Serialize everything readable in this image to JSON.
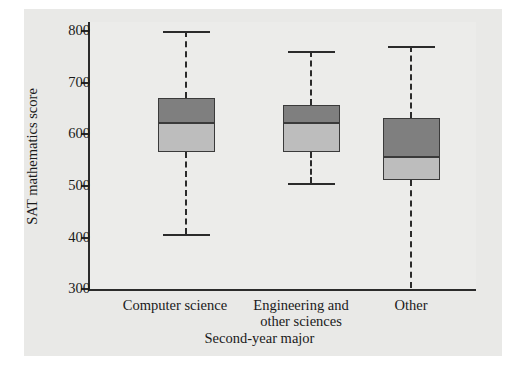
{
  "chart_data": {
    "type": "box",
    "title": "",
    "xlabel": "Second-year major",
    "ylabel": "SAT mathematics score",
    "ylim": [
      300,
      800
    ],
    "yticks": [
      300,
      400,
      500,
      600,
      700,
      800
    ],
    "ytick_labels": [
      "300",
      "400",
      "500",
      "600",
      "700",
      "800"
    ],
    "grid": false,
    "legend": "none",
    "categories": [
      "Computer science",
      "Engineering and other sciences",
      "Other"
    ],
    "boxes": [
      {
        "label": "Computer science",
        "min": 405,
        "q1": 565,
        "median": 620,
        "q3": 670,
        "max": 800
      },
      {
        "label": "Engineering and other sciences",
        "min": 505,
        "q1": 565,
        "median": 620,
        "q3": 655,
        "max": 760
      },
      {
        "label": "Other",
        "min": 300,
        "q1": 510,
        "median": 555,
        "q3": 630,
        "max": 770
      }
    ],
    "colors": {
      "upper_box_fill": "#7f7f7f",
      "lower_box_fill": "#bdbdbd",
      "box_edge": "#3a3a3a",
      "whisker": "#2b2b2b",
      "axis": "#2b2b2b",
      "panel_background": "#e9e9e7",
      "plot_background": "#ececea",
      "figure_background": "#ffffff"
    }
  },
  "axes": {
    "y_title": "SAT mathematics score",
    "x_title": "Second-year major",
    "y_tick_labels": [
      "800",
      "700",
      "600",
      "500",
      "400",
      "300"
    ]
  },
  "x_tick_labels": [
    {
      "line1": "Computer science",
      "line2": ""
    },
    {
      "line1": "Engineering and",
      "line2": "other sciences"
    },
    {
      "line1": "Other",
      "line2": ""
    }
  ]
}
